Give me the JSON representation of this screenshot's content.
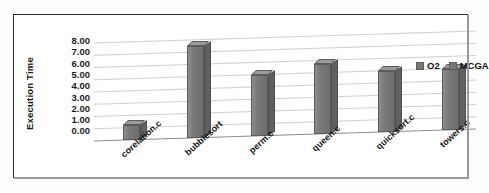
{
  "chart_data": {
    "type": "bar",
    "title": "",
    "xlabel": "",
    "ylabel": "Execution Time",
    "categories": [
      "corelation.c",
      "bubblesort",
      "perm.c",
      "queen.c",
      "quicksort.c",
      "towers.c"
    ],
    "series": [
      {
        "name": "O2",
        "values": [
          1.2,
          7.5,
          5.0,
          5.7,
          5.0,
          5.0
        ]
      },
      {
        "name": "MCGA",
        "values": [
          1.2,
          7.5,
          5.0,
          5.7,
          5.0,
          5.0
        ]
      }
    ],
    "ylim": [
      0,
      8
    ],
    "yticks": [
      "0.00",
      "1.00",
      "2.00",
      "3.00",
      "4.00",
      "5.00",
      "6.00",
      "7.00",
      "8.00"
    ],
    "ytick_values": [
      0,
      1,
      2,
      3,
      4,
      5,
      6,
      7,
      8
    ],
    "grid": true,
    "legend_position": "top-right",
    "legend": [
      "O2",
      "MCGA"
    ],
    "bar_color": "#787878",
    "grid_color": "#c9c9c9",
    "frame_color": "#2b2b2b"
  }
}
